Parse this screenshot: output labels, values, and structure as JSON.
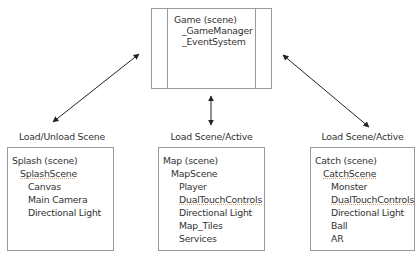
{
  "root": {
    "title": "Game (scene)",
    "children": [
      "_GameManager",
      "_EventSystem"
    ]
  },
  "connectors": [
    {
      "label": "Load/Unload Scene",
      "target": "splash"
    },
    {
      "label": "Load Scene/Active",
      "target": "map"
    },
    {
      "label": "Load Scene/Active",
      "target": "catch"
    }
  ],
  "scenes": {
    "splash": {
      "title": "Splash (scene)",
      "root_object": "SplashScene",
      "children": [
        "Canvas",
        "Main Camera",
        "Directional Light"
      ]
    },
    "map": {
      "title": "Map (scene)",
      "root_object": "MapScene",
      "children": [
        "Player",
        "DualTouchControls",
        "Directional Light",
        "Map_Tiles",
        "Services"
      ]
    },
    "catch": {
      "title": "Catch (scene)",
      "root_object": "CatchScene",
      "children": [
        "Monster",
        "DualTouchControls",
        "Directional Light",
        "Ball",
        "AR"
      ]
    }
  },
  "colors": {
    "border": "#9a9a9a",
    "text": "#333333",
    "arrow": "#222222",
    "spellcheck_underline": "#e0a070"
  }
}
